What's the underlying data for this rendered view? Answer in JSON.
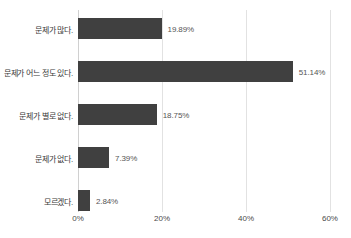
{
  "chart_data": {
    "type": "bar",
    "orientation": "horizontal",
    "title": "",
    "subtitle": "",
    "xlabel": "",
    "ylabel": "",
    "xlim": [
      0,
      60
    ],
    "xticks": [
      0,
      20,
      40,
      60
    ],
    "xtick_labels": [
      "0%",
      "20%",
      "40%",
      "60%"
    ],
    "grid": "vertical",
    "legend": "none",
    "bar_color": "#404040",
    "gridline_color": "#e2e2e2",
    "background_color": "#ffffff",
    "categories": [
      "문제가 많다.",
      "문제가 어느 정도 있다.",
      "문제가 별로 없다.",
      "문제가 없다.",
      "모르겠다."
    ],
    "values": [
      19.89,
      51.14,
      18.75,
      7.39,
      2.84
    ],
    "data_labels": [
      "19.89%",
      "51.14%",
      "18.75%",
      "7.39%",
      "2.84%"
    ]
  }
}
